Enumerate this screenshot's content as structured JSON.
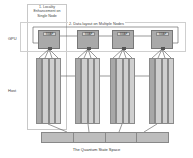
{
  "labels": {
    "locality": "1. Locality Enhancement on Single Node",
    "data_layout": "2. Data layout on Multiple Nodes",
    "gpu": "GPU",
    "host": "Host",
    "state_space": "The Quantum State Space"
  },
  "gpus": [
    {
      "swap_label": "SWAP"
    },
    {
      "swap_label": "SWAP"
    },
    {
      "swap_label": "SWAP"
    },
    {
      "swap_label": "SWAP"
    }
  ],
  "colors": {
    "gpu_fill": "#a9a9a9",
    "swap_fill": "#d4d4d4",
    "strip_light": "#cfcfcf",
    "strip_dark": "#a8a8a8",
    "state_bar": "#bdbdbd",
    "border": "#888888"
  }
}
